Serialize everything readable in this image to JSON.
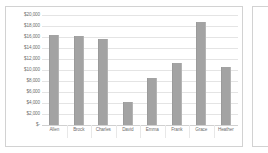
{
  "chart_data": {
    "type": "bar",
    "title": "",
    "subtitle": "",
    "xlabel": "",
    "ylabel": "",
    "grid": true,
    "legend": false,
    "legend_position": "none",
    "orientation": "vertical",
    "ylim": [
      0,
      20000
    ],
    "ytick_step": 2000,
    "categories": [
      "Allen",
      "Brock",
      "Charles",
      "David",
      "Emma",
      "Frank",
      "Grace",
      "Heather"
    ],
    "values": [
      16400,
      16200,
      15600,
      4200,
      8600,
      11300,
      18700,
      10600
    ],
    "ytick_labels": [
      "$20,000",
      "$18,000",
      "$16,000",
      "$14,000",
      "$12,000",
      "$10,000",
      "$8,000",
      "$6,000",
      "$4,000",
      "$2,000",
      "$-"
    ],
    "ytick_values": [
      20000,
      18000,
      16000,
      14000,
      12000,
      10000,
      8000,
      6000,
      4000,
      2000,
      0
    ],
    "series": [
      {
        "name": "",
        "values": [
          16400,
          16200,
          15600,
          4200,
          8600,
          11300,
          18700,
          10600
        ]
      }
    ],
    "colors": {
      "bar_fill": "#a3a3a3",
      "gridline": "#e4e4e4",
      "baseline": "#d0d0d0",
      "axis_text": "#6e6e6e",
      "chart_border": "#d2d2d2",
      "plot_background": "#ffffff"
    }
  }
}
